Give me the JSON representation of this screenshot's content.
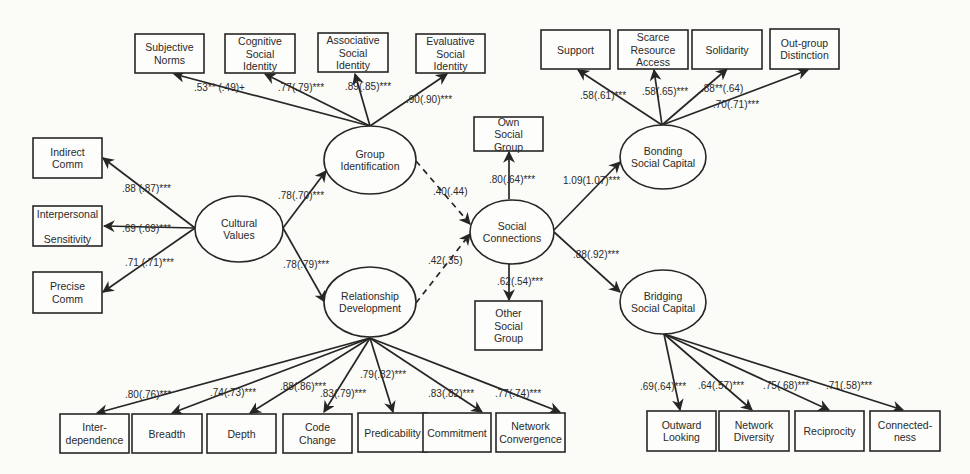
{
  "diagram": {
    "type": "structural-equation-model",
    "colors": {
      "stroke": "#262626",
      "text": "#2a2a2a",
      "background": "#fbfbf8"
    },
    "latent_variables": [
      {
        "id": "cv",
        "lines": [
          "Cultural",
          "Values"
        ],
        "cx": 239,
        "cy": 229,
        "rx": 44,
        "ry": 33
      },
      {
        "id": "gi",
        "lines": [
          "Group",
          "Identification"
        ],
        "cx": 370,
        "cy": 160,
        "rx": 46,
        "ry": 34
      },
      {
        "id": "rd",
        "lines": [
          "Relationship",
          "Development"
        ],
        "cx": 370,
        "cy": 302,
        "rx": 46,
        "ry": 35
      },
      {
        "id": "sc",
        "lines": [
          "Social",
          "Connections"
        ],
        "cx": 512,
        "cy": 232,
        "rx": 42,
        "ry": 32
      },
      {
        "id": "bo",
        "lines": [
          "Bonding",
          "Social Capital"
        ],
        "cx": 663,
        "cy": 157,
        "rx": 43,
        "ry": 32
      },
      {
        "id": "br",
        "lines": [
          "Bridging",
          "Social Capital"
        ],
        "cx": 663,
        "cy": 302,
        "rx": 43,
        "ry": 32
      }
    ],
    "indicators": [
      {
        "id": "sn",
        "lines": [
          "Subjective",
          "Norms"
        ],
        "x": 135,
        "y": 34,
        "w": 69,
        "h": 39
      },
      {
        "id": "csi",
        "lines": [
          "Cognitive",
          "Social",
          "Identity"
        ],
        "x": 225,
        "y": 34,
        "w": 70,
        "h": 39
      },
      {
        "id": "asi",
        "lines": [
          "Associative",
          "Social",
          "Identity"
        ],
        "x": 318,
        "y": 33,
        "w": 70,
        "h": 39
      },
      {
        "id": "esi",
        "lines": [
          "Evaluative",
          "Social",
          "Identity"
        ],
        "x": 416,
        "y": 34,
        "w": 69,
        "h": 39
      },
      {
        "id": "ic",
        "lines": [
          "Indirect",
          "Comm"
        ],
        "x": 33,
        "y": 138,
        "w": 69,
        "h": 40
      },
      {
        "id": "ips",
        "lines": [
          "Interpersonal",
          "",
          "Sensitivity"
        ],
        "x": 33,
        "y": 206,
        "w": 69,
        "h": 40
      },
      {
        "id": "pc",
        "lines": [
          "Precise",
          "Comm"
        ],
        "x": 33,
        "y": 272,
        "w": 69,
        "h": 41
      },
      {
        "id": "osg",
        "lines": [
          "Own",
          "Social",
          "Group"
        ],
        "x": 474,
        "y": 117,
        "w": 69,
        "h": 34
      },
      {
        "id": "otsg",
        "lines": [
          "Other",
          "Social",
          "Group"
        ],
        "x": 475,
        "y": 301,
        "w": 67,
        "h": 49
      },
      {
        "id": "sup",
        "lines": [
          "Support"
        ],
        "x": 541,
        "y": 30,
        "w": 69,
        "h": 39
      },
      {
        "id": "sra",
        "lines": [
          "Scarce",
          "Resource",
          "Access"
        ],
        "x": 618,
        "y": 30,
        "w": 70,
        "h": 39
      },
      {
        "id": "sol",
        "lines": [
          "Solidarity"
        ],
        "x": 692,
        "y": 30,
        "w": 70,
        "h": 39
      },
      {
        "id": "ogd",
        "lines": [
          "Out-group",
          "Distinction"
        ],
        "x": 770,
        "y": 29,
        "w": 69,
        "h": 40
      },
      {
        "id": "int",
        "lines": [
          "Inter-",
          "dependence"
        ],
        "x": 60,
        "y": 414,
        "w": 69,
        "h": 39
      },
      {
        "id": "bre",
        "lines": [
          "Breadth"
        ],
        "x": 132,
        "y": 414,
        "w": 70,
        "h": 39
      },
      {
        "id": "dep",
        "lines": [
          "Depth"
        ],
        "x": 207,
        "y": 414,
        "w": 69,
        "h": 39
      },
      {
        "id": "cch",
        "lines": [
          "Code",
          "Change"
        ],
        "x": 283,
        "y": 414,
        "w": 69,
        "h": 39
      },
      {
        "id": "pre",
        "lines": [
          "Predicability"
        ],
        "x": 358,
        "y": 413,
        "w": 69,
        "h": 39
      },
      {
        "id": "com",
        "lines": [
          "Commitment"
        ],
        "x": 423,
        "y": 413,
        "w": 68,
        "h": 39
      },
      {
        "id": "nco",
        "lines": [
          "Network",
          "Convergence"
        ],
        "x": 496,
        "y": 413,
        "w": 69,
        "h": 39
      },
      {
        "id": "owl",
        "lines": [
          "Outward",
          "Looking"
        ],
        "x": 647,
        "y": 411,
        "w": 69,
        "h": 40
      },
      {
        "id": "ndi",
        "lines": [
          "Network",
          "Diversity"
        ],
        "x": 719,
        "y": 411,
        "w": 70,
        "h": 40
      },
      {
        "id": "rec",
        "lines": [
          "Reciprocity"
        ],
        "x": 795,
        "y": 411,
        "w": 69,
        "h": 40
      },
      {
        "id": "con",
        "lines": [
          "Connected-",
          "ness"
        ],
        "x": 870,
        "y": 411,
        "w": 70,
        "h": 40
      }
    ],
    "paths": [
      {
        "from": "gi",
        "to": "sn",
        "label": ".53** (.49)+",
        "x1": 370,
        "y1": 126,
        "x2": 174,
        "y2": 74,
        "lx": 194,
        "ly": 91
      },
      {
        "from": "gi",
        "to": "csi",
        "label": ".77(.79)***",
        "x1": 370,
        "y1": 126,
        "x2": 265,
        "y2": 74,
        "lx": 278,
        "ly": 91
      },
      {
        "from": "gi",
        "to": "asi",
        "label": ".89(.85)***",
        "x1": 370,
        "y1": 126,
        "x2": 355,
        "y2": 74,
        "lx": 345,
        "ly": 90
      },
      {
        "from": "gi",
        "to": "esi",
        "label": ".90(.90)***",
        "x1": 370,
        "y1": 126,
        "x2": 447,
        "y2": 74,
        "lx": 406,
        "ly": 103
      },
      {
        "from": "cv",
        "to": "ic",
        "label": ".88 (.87)***",
        "x1": 195,
        "y1": 228,
        "x2": 103,
        "y2": 158,
        "lx": 122,
        "ly": 192
      },
      {
        "from": "cv",
        "to": "ips",
        "label": ".69 (.69)***",
        "x1": 195,
        "y1": 228,
        "x2": 104,
        "y2": 226,
        "lx": 122,
        "ly": 232
      },
      {
        "from": "cv",
        "to": "pc",
        "label": ".71 (.71)***",
        "x1": 195,
        "y1": 228,
        "x2": 103,
        "y2": 292,
        "lx": 125,
        "ly": 266
      },
      {
        "from": "cv",
        "to": "gi",
        "label": ".78(.70)***",
        "x1": 283,
        "y1": 228,
        "x2": 326,
        "y2": 171,
        "lx": 278,
        "ly": 199
      },
      {
        "from": "cv",
        "to": "rd",
        "label": ".78(.79)***",
        "x1": 283,
        "y1": 228,
        "x2": 325,
        "y2": 302,
        "lx": 283,
        "ly": 268
      },
      {
        "from": "gi",
        "to": "sc",
        "label": ".40(.44)",
        "x1": 416,
        "y1": 161,
        "x2": 470,
        "y2": 224,
        "lx": 433,
        "ly": 195,
        "dashed": true
      },
      {
        "from": "rd",
        "to": "sc",
        "label": ".42(.35)",
        "x1": 416,
        "y1": 303,
        "x2": 470,
        "y2": 234,
        "lx": 428,
        "ly": 264,
        "dashed": true
      },
      {
        "from": "sc",
        "to": "osg",
        "label": ".80(.64)***",
        "x1": 509,
        "y1": 199,
        "x2": 509,
        "y2": 152,
        "lx": 489,
        "ly": 183
      },
      {
        "from": "sc",
        "to": "otsg",
        "label": ".62(.54)***",
        "x1": 509,
        "y1": 264,
        "x2": 509,
        "y2": 300,
        "lx": 497,
        "ly": 285
      },
      {
        "from": "sc",
        "to": "bo",
        "label": "1.09(1.07)***",
        "x1": 554,
        "y1": 230,
        "x2": 620,
        "y2": 162,
        "lx": 563,
        "ly": 184
      },
      {
        "from": "sc",
        "to": "br",
        "label": ".88(.92)***",
        "x1": 554,
        "y1": 232,
        "x2": 620,
        "y2": 292,
        "lx": 573,
        "ly": 258
      },
      {
        "from": "bo",
        "to": "sup",
        "label": ".58(.61)***",
        "x1": 662,
        "y1": 125,
        "x2": 578,
        "y2": 70,
        "lx": 580,
        "ly": 99
      },
      {
        "from": "bo",
        "to": "sra",
        "label": ".58(.65)***",
        "x1": 662,
        "y1": 125,
        "x2": 654,
        "y2": 70,
        "lx": 642,
        "ly": 95
      },
      {
        "from": "bo",
        "to": "sol",
        "label": ".88**(.64)",
        "x1": 662,
        "y1": 125,
        "x2": 727,
        "y2": 69,
        "lx": 701,
        "ly": 92
      },
      {
        "from": "bo",
        "to": "ogd",
        "label": ".70(.71)***",
        "x1": 662,
        "y1": 125,
        "x2": 808,
        "y2": 70,
        "lx": 713,
        "ly": 108
      },
      {
        "from": "rd",
        "to": "int",
        "label": ".80(.76)***",
        "x1": 370,
        "y1": 338,
        "x2": 97,
        "y2": 413,
        "lx": 125,
        "ly": 398
      },
      {
        "from": "rd",
        "to": "bre",
        "label": ".74(.73)***",
        "x1": 370,
        "y1": 338,
        "x2": 172,
        "y2": 413,
        "lx": 210,
        "ly": 396
      },
      {
        "from": "rd",
        "to": "dep",
        "label": ".88(.86)***",
        "x1": 370,
        "y1": 338,
        "x2": 250,
        "y2": 413,
        "lx": 280,
        "ly": 390
      },
      {
        "from": "rd",
        "to": "cch",
        "label": ".83(.79)***",
        "x1": 370,
        "y1": 338,
        "x2": 324,
        "y2": 412,
        "lx": 320,
        "ly": 397
      },
      {
        "from": "rd",
        "to": "pre",
        "label": ".79(.82)***",
        "x1": 370,
        "y1": 338,
        "x2": 393,
        "y2": 412,
        "lx": 360,
        "ly": 378
      },
      {
        "from": "rd",
        "to": "com",
        "label": ".83(.82)***",
        "x1": 370,
        "y1": 338,
        "x2": 482,
        "y2": 412,
        "lx": 428,
        "ly": 397
      },
      {
        "from": "rd",
        "to": "nco",
        "label": ".77(.74)***",
        "x1": 370,
        "y1": 338,
        "x2": 560,
        "y2": 412,
        "lx": 495,
        "ly": 397
      },
      {
        "from": "br",
        "to": "owl",
        "label": ".69(.64)***",
        "x1": 664,
        "y1": 334,
        "x2": 680,
        "y2": 410,
        "lx": 640,
        "ly": 390
      },
      {
        "from": "br",
        "to": "ndi",
        "label": ".64(.57)***",
        "x1": 664,
        "y1": 334,
        "x2": 752,
        "y2": 410,
        "lx": 698,
        "ly": 389
      },
      {
        "from": "br",
        "to": "rec",
        "label": ".75(.68)***",
        "x1": 664,
        "y1": 334,
        "x2": 829,
        "y2": 410,
        "lx": 763,
        "ly": 389
      },
      {
        "from": "br",
        "to": "con",
        "label": ".71(.58)***",
        "x1": 664,
        "y1": 334,
        "x2": 903,
        "y2": 410,
        "lx": 826,
        "ly": 389
      }
    ]
  }
}
